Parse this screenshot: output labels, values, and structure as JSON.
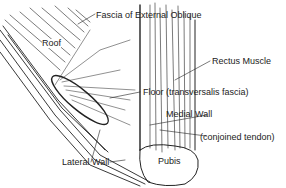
{
  "diagram": {
    "labels": {
      "fascia": "Fascia of External Oblique",
      "roof": "Roof",
      "rectus": "Rectus Muscle",
      "floor": "Floor (transversalis fascia)",
      "medial": "Medial Wall",
      "conjoined": "(conjoined tendon)",
      "lateral": "Lateral Wall",
      "pubis": "Pubis"
    },
    "colors": {
      "ink": "#222222",
      "background": "#ffffff"
    }
  }
}
